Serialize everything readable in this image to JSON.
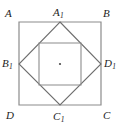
{
  "figure": {
    "canvas": {
      "width": 120,
      "height": 129
    },
    "colors": {
      "background": "#ffffff",
      "outer_square_stroke": "#8c8c8c",
      "diamond_stroke": "#6e6e6e",
      "inner_square_stroke": "#8c8c8c",
      "center_dot": "#4a4a4a",
      "label_text": "#1d1d1d"
    },
    "outer_square": {
      "name": "ABCD",
      "points": [
        [
          19,
          22
        ],
        [
          101,
          22
        ],
        [
          101,
          105
        ],
        [
          19,
          105
        ]
      ],
      "stroke_width": 1.2
    },
    "diamond": {
      "name": "A1B1C1D1",
      "points": [
        [
          60,
          22
        ],
        [
          101,
          64
        ],
        [
          60,
          105
        ],
        [
          19,
          64
        ]
      ],
      "stroke_width": 1.1
    },
    "inner_square": {
      "points": [
        [
          39,
          43
        ],
        [
          81,
          43
        ],
        [
          81,
          85
        ],
        [
          39,
          85
        ]
      ],
      "stroke_width": 1.1
    },
    "center_point": {
      "x": 60,
      "y": 64,
      "radius": 1.1
    },
    "labels": [
      {
        "id": "A",
        "text": "A",
        "sub": "",
        "role": "outer-square-vertex"
      },
      {
        "id": "B",
        "text": "B",
        "sub": "",
        "role": "outer-square-vertex"
      },
      {
        "id": "C",
        "text": "C",
        "sub": "",
        "role": "outer-square-vertex"
      },
      {
        "id": "D",
        "text": "D",
        "sub": "",
        "role": "outer-square-vertex"
      },
      {
        "id": "A1",
        "text": "A",
        "sub": "1",
        "role": "diamond-vertex-top"
      },
      {
        "id": "B1",
        "text": "B",
        "sub": "1",
        "role": "diamond-vertex-left"
      },
      {
        "id": "C1",
        "text": "C",
        "sub": "1",
        "role": "diamond-vertex-bottom"
      },
      {
        "id": "D1",
        "text": "D",
        "sub": "1",
        "role": "diamond-vertex-right"
      }
    ]
  }
}
